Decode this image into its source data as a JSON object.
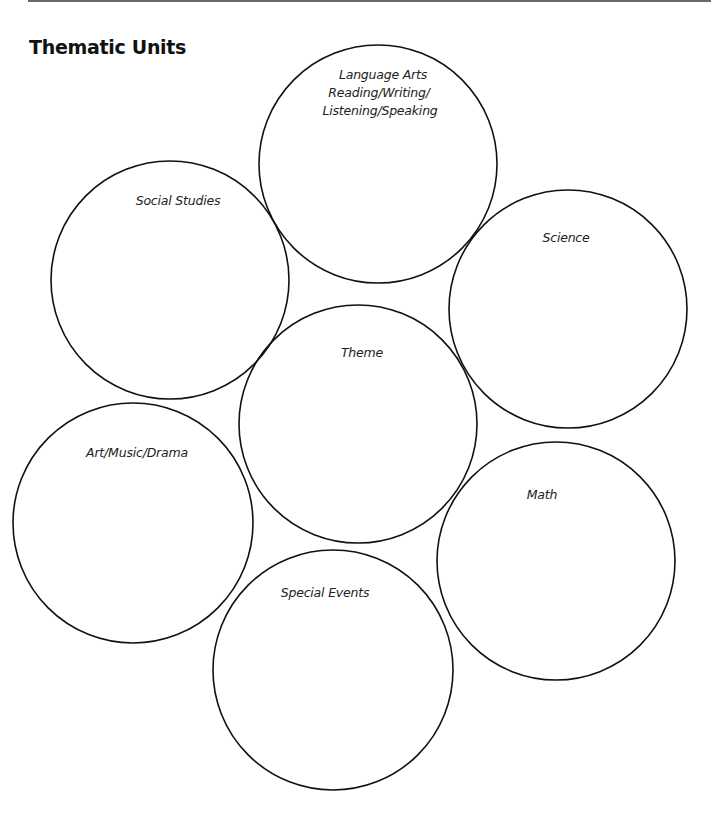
{
  "title": "Thematic Units",
  "circles": [
    {
      "id": "language-arts",
      "label_lines": [
        "Language Arts",
        "Reading/Writing/",
        "Listening/Speaking"
      ]
    },
    {
      "id": "social-studies",
      "label_lines": [
        "Social Studies"
      ]
    },
    {
      "id": "science",
      "label_lines": [
        "Science"
      ]
    },
    {
      "id": "theme",
      "label_lines": [
        "Theme"
      ]
    },
    {
      "id": "art-music-drama",
      "label_lines": [
        "Art/Music/Drama"
      ]
    },
    {
      "id": "math",
      "label_lines": [
        "Math"
      ]
    },
    {
      "id": "special-events",
      "label_lines": [
        "Special Events"
      ]
    }
  ]
}
